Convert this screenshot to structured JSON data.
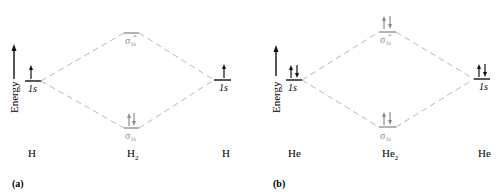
{
  "panels": [
    {
      "id": "a",
      "caption": "(a)",
      "energy_label": "Energy",
      "left_atom": {
        "label": "H",
        "orbital": "1s",
        "electrons": "up"
      },
      "right_atom": {
        "label": "H",
        "orbital": "1s",
        "electrons": "up"
      },
      "molecule": {
        "label_base": "H",
        "label_sub": "2",
        "antibonding": {
          "symbol": "σ",
          "sub": "1s",
          "sup": "*",
          "electrons": "none"
        },
        "bonding": {
          "symbol": "σ",
          "sub": "1s",
          "electrons": "updown"
        }
      }
    },
    {
      "id": "b",
      "caption": "(b)",
      "energy_label": "Energy",
      "left_atom": {
        "label": "He",
        "orbital": "1s",
        "electrons": "updown"
      },
      "right_atom": {
        "label": "He",
        "orbital": "1s",
        "electrons": "updown"
      },
      "molecule": {
        "label_base": "He",
        "label_sub": "2",
        "antibonding": {
          "symbol": "σ",
          "sub": "1s",
          "sup": "*",
          "electrons": "updown"
        },
        "bonding": {
          "symbol": "σ",
          "sub": "1s",
          "electrons": "updown"
        }
      }
    }
  ],
  "colors": {
    "atomic": "#111111",
    "molecular": "#8a8a8a",
    "dashed": "#b5b5b5"
  }
}
